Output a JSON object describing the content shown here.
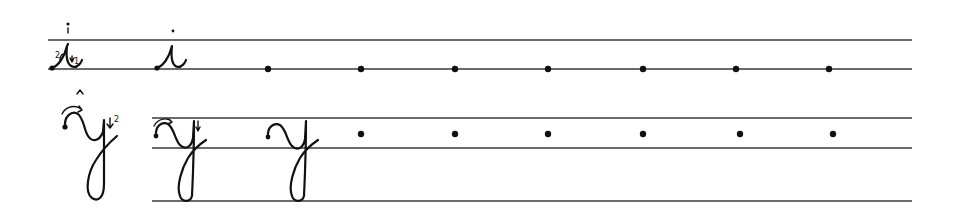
{
  "worksheet": {
    "type": "cursive handwriting practice",
    "ink_color": "#111111",
    "line_color": "#3a3a3a",
    "rows": [
      {
        "letter": "i",
        "guide_strokes": [
          "1",
          "2"
        ],
        "line_start_x": 48,
        "line_end_x": 912,
        "lines_y": [
          40,
          69
        ],
        "practice_dots": [
          {
            "x": 268,
            "y": 69
          },
          {
            "x": 361,
            "y": 69
          },
          {
            "x": 455,
            "y": 69
          },
          {
            "x": 548,
            "y": 69
          },
          {
            "x": 643,
            "y": 69
          },
          {
            "x": 736,
            "y": 69
          },
          {
            "x": 829,
            "y": 69
          }
        ]
      },
      {
        "letter": "y",
        "guide_strokes": [
          "1",
          "2"
        ],
        "line_start_x": 152,
        "line_end_x": 912,
        "lines_y": [
          118,
          148,
          201
        ],
        "practice_dots": [
          {
            "x": 361,
            "y": 134
          },
          {
            "x": 455,
            "y": 134
          },
          {
            "x": 548,
            "y": 134
          },
          {
            "x": 643,
            "y": 134
          },
          {
            "x": 740,
            "y": 134
          },
          {
            "x": 833,
            "y": 134
          }
        ]
      }
    ],
    "labels": {
      "i_stroke_1": "1",
      "i_stroke_2": "2",
      "y_stroke_1": "1",
      "y_stroke_2": "2"
    }
  }
}
